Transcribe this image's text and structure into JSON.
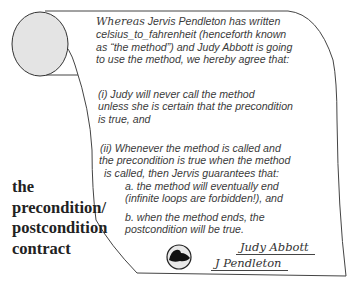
{
  "contract": {
    "intro_lead": "Whereas",
    "intro_lines": [
      " Jervis Pendleton has written",
      "celsius_to_fahrenheit (henceforth known",
      "as  “the method”) and Judy Abbott is going",
      "to use the method, we hereby agree that:"
    ],
    "clause_i": [
      "(i) Judy will never call the method",
      "unless she is certain that the precondition",
      "is true, and"
    ],
    "clause_ii": [
      "(ii) Whenever the method is called and",
      "the precondition is true when the method",
      "is called, then Jervis guarantees that:"
    ],
    "sub_a": [
      "a. the method will eventually end",
      "(infinite loops are forbidden!), and"
    ],
    "sub_b": [
      "b. when the method ends, the",
      "postcondition will be true."
    ],
    "seal_icon": "walrus-seal-icon",
    "signatures": [
      "Judy Abbott",
      "J Pendleton"
    ]
  },
  "side_title": [
    "the",
    "precondition/",
    "postcondition",
    "contract"
  ]
}
